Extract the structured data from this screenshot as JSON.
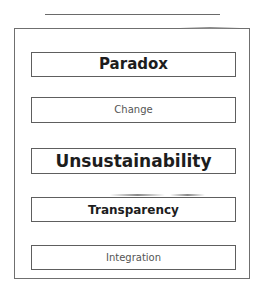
{
  "diagram": {
    "title_rule": true,
    "items": [
      {
        "label": "Paradox",
        "emphasis": "bold",
        "font_size": 15
      },
      {
        "label": "Change",
        "emphasis": "light",
        "font_size": 10
      },
      {
        "label": "Unsustainability",
        "emphasis": "bold",
        "font_size": 17
      },
      {
        "label": "Transparency",
        "emphasis": "bold",
        "font_size": 12
      },
      {
        "label": "Integration",
        "emphasis": "light",
        "font_size": 10
      }
    ]
  }
}
